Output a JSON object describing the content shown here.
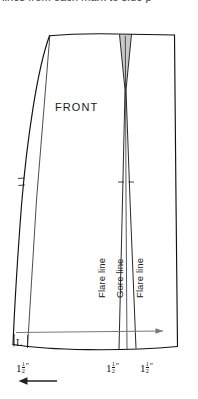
{
  "figure": {
    "caption_top": "lines from each mark to side p",
    "panel_label": "FRONT",
    "corner_marker": "L",
    "vertical_labels": [
      {
        "id": "flare-line-left",
        "text": "Flare line"
      },
      {
        "id": "gore-line",
        "text": "Gore line"
      },
      {
        "id": "flare-line-right",
        "text": "Flare line"
      }
    ],
    "measurements": [
      {
        "id": "hem-measure-left",
        "whole": "1",
        "numerator": "1",
        "denominator": "2",
        "unit": "″"
      },
      {
        "id": "hem-measure-center",
        "whole": "1",
        "numerator": "1",
        "denominator": "2",
        "unit": "″"
      },
      {
        "id": "hem-measure-right",
        "whole": "1",
        "numerator": "1",
        "denominator": "2",
        "unit": "″"
      }
    ],
    "colors": {
      "ink": "#1a1a1a",
      "outline": "#111111",
      "construction_line": "#777777",
      "dart_fill": "#c9c9c9",
      "arrow": "#555555",
      "background": "#ffffff"
    }
  }
}
